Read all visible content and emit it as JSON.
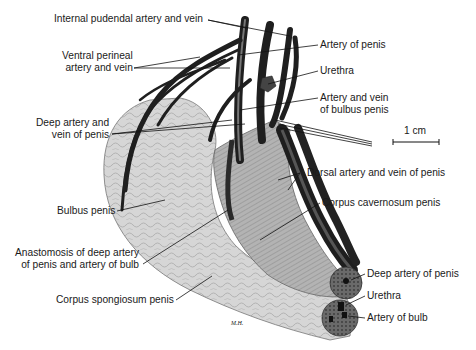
{
  "figure": {
    "signature": "M.H.",
    "scale_bar": {
      "label": "1 cm"
    }
  },
  "labels_left": [
    {
      "id": "internal-pudendal",
      "lines": [
        "Internal pudendal artery and vein"
      ]
    },
    {
      "id": "ventral-perineal",
      "lines": [
        "Ventral perineal",
        "artery and vein"
      ]
    },
    {
      "id": "deep-artery-vein",
      "lines": [
        "Deep artery and",
        "vein of penis"
      ]
    },
    {
      "id": "bulbus-penis",
      "lines": [
        "Bulbus penis"
      ]
    },
    {
      "id": "anastomosis",
      "lines": [
        "Anastomosis of deep artery",
        "of penis and artery of bulb"
      ]
    },
    {
      "id": "corpus-spongiosum",
      "lines": [
        "Corpus spongiosum penis"
      ]
    }
  ],
  "labels_right": [
    {
      "id": "artery-of-penis",
      "lines": [
        "Artery of penis"
      ]
    },
    {
      "id": "urethra-top",
      "lines": [
        "Urethra"
      ]
    },
    {
      "id": "artery-vein-bulbus",
      "lines": [
        "Artery and vein",
        "of bulbus penis"
      ]
    },
    {
      "id": "dorsal-artery-vein",
      "lines": [
        "Dorsal artery and vein of penis"
      ]
    },
    {
      "id": "corpus-cavernosum",
      "lines": [
        "Corpus cavernosum penis"
      ]
    },
    {
      "id": "deep-artery-of-penis",
      "lines": [
        "Deep artery of penis"
      ]
    },
    {
      "id": "urethra-bottom",
      "lines": [
        "Urethra"
      ]
    },
    {
      "id": "artery-of-bulb",
      "lines": [
        "Artery of bulb"
      ]
    }
  ],
  "colors": {
    "background": "#ffffff",
    "text": "#1a1a1a",
    "leader": "#111111",
    "spongiosum": "#d4d4d4",
    "cavernosum": "#a9a9a9",
    "vessel": "#2a2a2a"
  }
}
